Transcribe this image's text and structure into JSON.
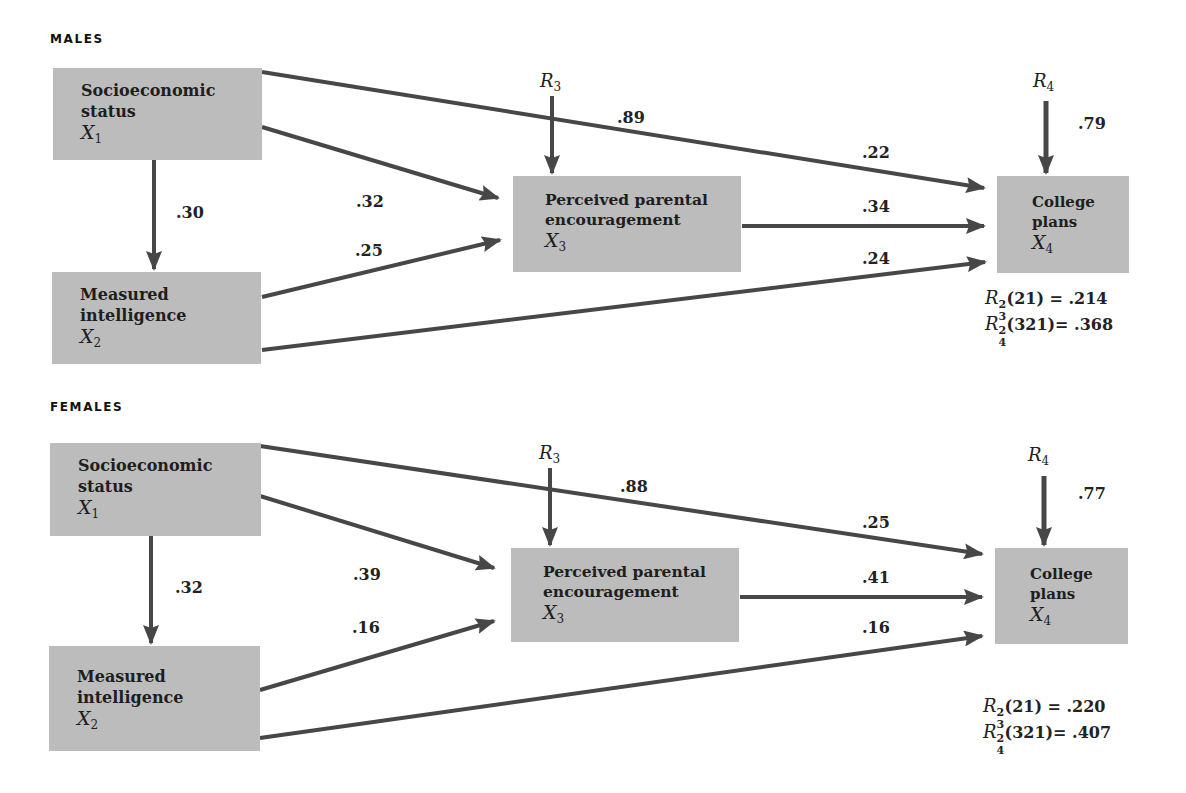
{
  "panels": [
    {
      "label": "MALES",
      "boxes": {
        "x1": {
          "line1": "Socioeconomic",
          "line2": "status",
          "var": "X",
          "sub": "1"
        },
        "x2": {
          "line1": "Measured",
          "line2": "intelligence",
          "var": "X",
          "sub": "2"
        },
        "x3": {
          "line1": "Perceived parental",
          "line2": "encouragement",
          "var": "X",
          "sub": "3"
        },
        "x4": {
          "line1": "College",
          "line2": "plans",
          "var": "X",
          "sub": "4"
        }
      },
      "residuals": {
        "r3": {
          "var": "R",
          "sub": "3"
        },
        "r4": {
          "var": "R",
          "sub": "4",
          "coef": ".79"
        }
      },
      "paths": {
        "x1_x2": ".30",
        "x1_x3": ".32",
        "x2_x3": ".25",
        "x1_x4": ".22",
        "x3_x4": ".34",
        "x2_x4": ".24",
        "r3_x3": ".89"
      },
      "stats": {
        "r2_3": {
          "var": "R",
          "sup": "2",
          "sub": "3",
          "args": "(21)",
          "eq": " = ",
          "value": ".214"
        },
        "r2_4": {
          "var": "R",
          "sup": "2",
          "sub": "4",
          "args": "(321)",
          "eq": "= ",
          "value": ".368"
        }
      }
    },
    {
      "label": "FEMALES",
      "boxes": {
        "x1": {
          "line1": "Socioeconomic",
          "line2": "status",
          "var": "X",
          "sub": "1"
        },
        "x2": {
          "line1": "Measured",
          "line2": "intelligence",
          "var": "X",
          "sub": "2"
        },
        "x3": {
          "line1": "Perceived parental",
          "line2": "encouragement",
          "var": "X",
          "sub": "3"
        },
        "x4": {
          "line1": "College",
          "line2": "plans",
          "var": "X",
          "sub": "4"
        }
      },
      "residuals": {
        "r3": {
          "var": "R",
          "sub": "3"
        },
        "r4": {
          "var": "R",
          "sub": "4",
          "coef": ".77"
        }
      },
      "paths": {
        "x1_x2": ".32",
        "x1_x3": ".39",
        "x2_x3": ".16",
        "x1_x4": ".25",
        "x3_x4": ".41",
        "x2_x4": ".16",
        "r3_x3": ".88"
      },
      "stats": {
        "r2_3": {
          "var": "R",
          "sup": "2",
          "sub": "3",
          "args": "(21)",
          "eq": " = ",
          "value": ".220"
        },
        "r2_4": {
          "var": "R",
          "sup": "2",
          "sub": "4",
          "args": "(321)",
          "eq": "= ",
          "value": ".407"
        }
      }
    }
  ],
  "colors": {
    "box": "#bcbcbc",
    "arrow": "#474747",
    "text": "#1e1e1e"
  }
}
